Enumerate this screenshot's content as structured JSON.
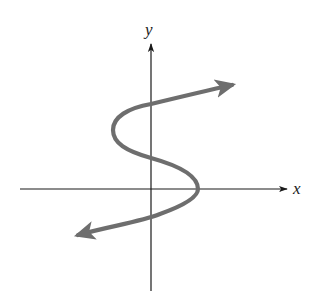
{
  "diagram": {
    "type": "graph-of-relation",
    "axes": {
      "x_label": "x",
      "y_label": "y"
    },
    "colors": {
      "axis": "#1a1a1a",
      "curve": "#6e6e6e",
      "background": "#ffffff"
    }
  }
}
